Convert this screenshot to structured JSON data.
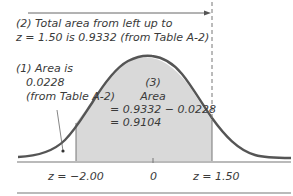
{
  "figure": {
    "annotation_total": {
      "line1": "(2) Total area from left up to",
      "line2": "z = 1.50 is 0.9332 (from Table A-2)"
    },
    "annotation_left": {
      "line1": "(1) Area is",
      "line2": "0.0228",
      "line3": "(from Table A-2)"
    },
    "annotation_middle": {
      "line1": "(3)",
      "line2": "Area",
      "line3": "= 0.9332 − 0.0228",
      "line4": "= 0.9104"
    },
    "axis_labels": {
      "left": "z = −2.00",
      "center": "0",
      "right": "z = 1.50"
    },
    "colors": {
      "curve": "#555555",
      "shade": "#d9d9d9",
      "text": "#3a3a3a"
    }
  }
}
